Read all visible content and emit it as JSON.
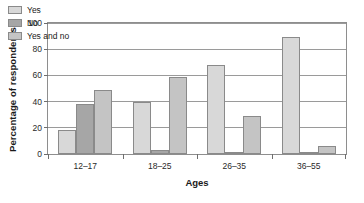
{
  "chart_data": {
    "type": "bar",
    "title": "",
    "xlabel": "Ages",
    "ylabel": "Percentage of respondents",
    "categories": [
      "12–17",
      "18–25",
      "26–35",
      "36–55"
    ],
    "series": [
      {
        "name": "Yes",
        "values": [
          18,
          40,
          68,
          89
        ],
        "color": "#d8d8d8"
      },
      {
        "name": "No",
        "values": [
          38,
          3,
          1,
          1
        ],
        "color": "#a6a6a6"
      },
      {
        "name": "Yes and no",
        "values": [
          49,
          59,
          29,
          6
        ],
        "color": "#c4c4c4"
      }
    ],
    "ylim": [
      0,
      100
    ],
    "yticks": [
      0,
      20,
      40,
      60,
      80,
      100
    ],
    "ytick_labels": [
      "0",
      "20",
      "40",
      "60",
      "80",
      "100"
    ],
    "grid": true,
    "legend_position": "upper left inside"
  }
}
